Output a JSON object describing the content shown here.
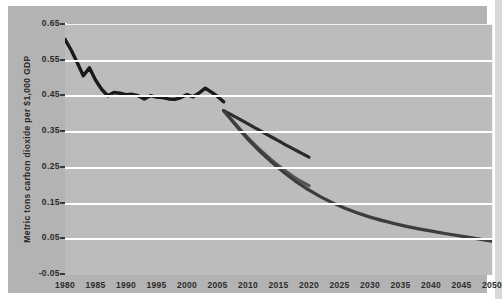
{
  "chart_data": {
    "type": "line",
    "title": "",
    "subtitle": "",
    "xlabel": "",
    "ylabel": "Metric tons carbon dioxide per $1,000 GDP",
    "xlim": [
      1980,
      2050
    ],
    "ylim": [
      -0.05,
      0.65
    ],
    "grid": true,
    "legend_position": "none",
    "x_tick_labels": [
      "1980",
      "1985",
      "1990",
      "1995",
      "2000",
      "2005",
      "2010",
      "2015",
      "2020",
      "2025",
      "2030",
      "2035",
      "2040",
      "2045",
      "2050"
    ],
    "y_tick_labels": [
      "0.65",
      "0.55",
      "0.45",
      "0.35",
      "0.25",
      "0.15",
      "0.05",
      "-0.05"
    ],
    "y_tick_values": [
      0.65,
      0.55,
      0.45,
      0.35,
      0.25,
      0.15,
      0.05,
      -0.05
    ],
    "colors": {
      "history": "#1a1a1a",
      "projection_low": "#2b2b2b",
      "projection_mid": "#555555",
      "projection_high": "#3d3d3d",
      "background": "#b3b3b3",
      "plot_background": "#bcbcbc",
      "gridline": "#ffffff",
      "text": "#2b2b2b"
    },
    "series": [
      {
        "name": "History",
        "kind": "history",
        "color": "#1a1a1a",
        "x": [
          1980,
          1981,
          1982,
          1983,
          1984,
          1985,
          1986,
          1987,
          1988,
          1989,
          1990,
          1991,
          1992,
          1993,
          1994,
          1995,
          1996,
          1997,
          1998,
          1999,
          2000,
          2001,
          2002,
          2003,
          2004,
          2005,
          2006
        ],
        "values": [
          0.61,
          0.58,
          0.545,
          0.508,
          0.53,
          0.496,
          0.47,
          0.452,
          0.461,
          0.459,
          0.455,
          0.456,
          0.452,
          0.443,
          0.452,
          0.448,
          0.447,
          0.443,
          0.442,
          0.447,
          0.455,
          0.449,
          0.46,
          0.473,
          0.462,
          0.45,
          0.435
        ]
      },
      {
        "name": "Projection - upper",
        "kind": "projection",
        "color": "#2b2b2b",
        "x": [
          2006,
          2008,
          2010,
          2012,
          2014,
          2016,
          2018,
          2020
        ],
        "values": [
          0.41,
          0.392,
          0.373,
          0.354,
          0.335,
          0.316,
          0.298,
          0.28
        ]
      },
      {
        "name": "Projection - middle",
        "kind": "projection",
        "color": "#555555",
        "x": [
          2006,
          2008,
          2010,
          2012,
          2014,
          2016,
          2018,
          2020
        ],
        "values": [
          0.41,
          0.372,
          0.334,
          0.3,
          0.27,
          0.243,
          0.219,
          0.2
        ]
      },
      {
        "name": "Projection - lower",
        "kind": "projection",
        "color": "#3d3d3d",
        "x": [
          2006,
          2010,
          2014,
          2018,
          2022,
          2026,
          2030,
          2034,
          2038,
          2042,
          2046,
          2050
        ],
        "values": [
          0.41,
          0.33,
          0.264,
          0.21,
          0.168,
          0.136,
          0.112,
          0.094,
          0.079,
          0.067,
          0.056,
          0.045
        ]
      }
    ]
  }
}
